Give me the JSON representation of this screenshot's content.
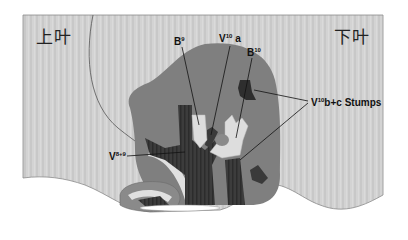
{
  "diagram": {
    "lobes": {
      "upper": "上叶",
      "lower": "下叶"
    },
    "labels": {
      "b9": {
        "base": "B",
        "sup": "9",
        "suffix": ""
      },
      "v10a": {
        "base": "V",
        "sup": "10",
        "suffix": " a"
      },
      "b10": {
        "base": "B",
        "sup": "10",
        "suffix": ""
      },
      "v10bc": {
        "base": "V",
        "sup": "10",
        "suffix": "b+c Stumps"
      },
      "v89": {
        "base": "V",
        "sup": "8+9",
        "suffix": ""
      }
    },
    "colors": {
      "lung_bg": "#d0d0d0",
      "segment": "#7e7e7e",
      "vessel_dark": "#3a3a3a",
      "bronchus_light": "#dcdcdc",
      "outline": "#6a6a6a",
      "label_text": "#111111"
    }
  }
}
